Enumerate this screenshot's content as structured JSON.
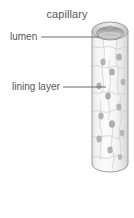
{
  "diagram": {
    "title": "capillary",
    "labels": [
      {
        "id": "lumen",
        "text": "lumen",
        "leader_line": {
          "x1": 41,
          "y1": 37,
          "x2": 99,
          "y2": 37
        }
      },
      {
        "id": "lining-layer",
        "text": "lining layer",
        "leader_line": {
          "x1": 63,
          "y1": 87,
          "x2": 106,
          "y2": 87
        }
      }
    ],
    "colors": {
      "text": "#585858",
      "leader_line": "#6b6b6b",
      "tube_outline": "#9a9a9a",
      "tube_fill": "#f2f2f2",
      "tube_shadow": "#dcdcdc",
      "lumen_fill": "#b9b9b9",
      "lumen_rim": "#8d8d8d",
      "cell_border": "#cfcfcf",
      "nucleus_fill": "#b0b0b0",
      "background": "#ffffff"
    },
    "tube": {
      "left": 92,
      "right": 128,
      "top": 22,
      "bottom": 172,
      "top_ellipse_ry": 9,
      "bottom_ellipse_ry": 8
    },
    "nuclei": [
      {
        "cx": 110,
        "cy": 31,
        "rx": 3.2,
        "ry": 2.2
      },
      {
        "cx": 119,
        "cy": 57,
        "rx": 2.8,
        "ry": 3.6
      },
      {
        "cx": 103,
        "cy": 62,
        "rx": 2.6,
        "ry": 3.4
      },
      {
        "cx": 112,
        "cy": 72,
        "rx": 2.8,
        "ry": 3.6
      },
      {
        "cx": 123,
        "cy": 82,
        "rx": 2.4,
        "ry": 3.2
      },
      {
        "cx": 99,
        "cy": 86,
        "rx": 2.6,
        "ry": 3.4
      },
      {
        "cx": 108,
        "cy": 96,
        "rx": 2.8,
        "ry": 3.6
      },
      {
        "cx": 119,
        "cy": 107,
        "rx": 2.6,
        "ry": 3.4
      },
      {
        "cx": 101,
        "cy": 116,
        "rx": 2.6,
        "ry": 3.4
      },
      {
        "cx": 112,
        "cy": 124,
        "rx": 3.0,
        "ry": 3.8
      },
      {
        "cx": 122,
        "cy": 133,
        "rx": 2.4,
        "ry": 3.2
      },
      {
        "cx": 99,
        "cy": 139,
        "rx": 2.6,
        "ry": 3.4
      },
      {
        "cx": 110,
        "cy": 150,
        "rx": 2.6,
        "ry": 3.4
      },
      {
        "cx": 120,
        "cy": 156,
        "rx": 2.2,
        "ry": 3.0
      }
    ]
  }
}
